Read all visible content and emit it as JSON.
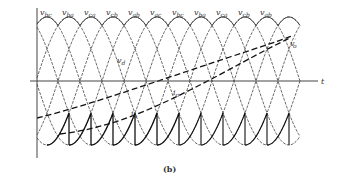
{
  "figure": {
    "caption": "(b)",
    "time_axis_label": "t",
    "phase_period_deg": 60,
    "phase_labels": [
      {
        "base": "v",
        "sub": "bc"
      },
      {
        "base": "v",
        "sub": "ba"
      },
      {
        "base": "v",
        "sub": "ca"
      },
      {
        "base": "v",
        "sub": "cb"
      },
      {
        "base": "v",
        "sub": "ab"
      },
      {
        "base": "v",
        "sub": "ac"
      },
      {
        "base": "v",
        "sub": "bc"
      },
      {
        "base": "v",
        "sub": "ba"
      },
      {
        "base": "v",
        "sub": "ca"
      },
      {
        "base": "v",
        "sub": "cb"
      },
      {
        "base": "v",
        "sub": "ab"
      }
    ],
    "annotations": {
      "vd": {
        "base": "v",
        "sub": "d"
      },
      "io": {
        "base": "i",
        "sub": "o"
      },
      "io2": {
        "base": "i",
        "sub": "o"
      },
      "vo": {
        "base": "v",
        "sub": "o",
        "prime": "′"
      }
    },
    "colors": {
      "line": "#333333",
      "envelope": "#111111"
    }
  }
}
